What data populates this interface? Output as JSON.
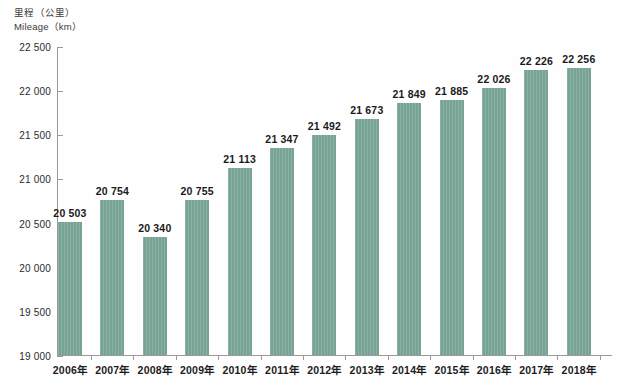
{
  "axis_title": {
    "line1": "里程（公里）",
    "line2": "Mileage（km）"
  },
  "colors": {
    "bar": "#76a393",
    "axis": "#9a9a9a",
    "label_text": "#1a1a1a",
    "background": "#ffffff"
  },
  "chart_data": {
    "type": "bar",
    "xlabel": "",
    "ylabel": "里程（公里）",
    "ylim": [
      19000,
      22500
    ],
    "ytick_step": 500,
    "grid": false,
    "legend": "none",
    "categories": [
      "2006年",
      "2007年",
      "2008年",
      "2009年",
      "2010年",
      "2011年",
      "2012年",
      "2013年",
      "2014年",
      "2015年",
      "2016年",
      "2017年",
      "2018年"
    ],
    "values": [
      20503,
      20754,
      20340,
      20755,
      21113,
      21347,
      21492,
      21673,
      21849,
      21885,
      22026,
      22226,
      22256
    ],
    "value_labels": [
      "20 503",
      "20 754",
      "20 340",
      "20 755",
      "21 113",
      "21 347",
      "21 492",
      "21 673",
      "21 849",
      "21 885",
      "22 026",
      "22 226",
      "22 256"
    ],
    "ytick_labels": [
      "22 500",
      "22 000",
      "21 500",
      "21 000",
      "20 500",
      "20 000",
      "19 500",
      "19 000"
    ],
    "ytick_values": [
      22500,
      22000,
      21500,
      21000,
      20500,
      20000,
      19500,
      19000
    ]
  }
}
